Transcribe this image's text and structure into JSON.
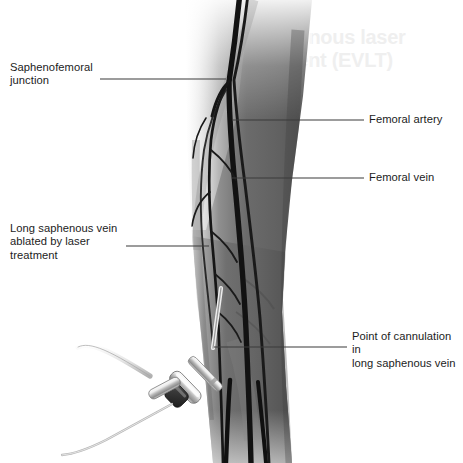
{
  "illustration": {
    "title": "Endovenous laser treatment of the long saphenous vein",
    "subject": "leg-venous-anatomy-with-laser-catheter",
    "background_color": "#ffffff",
    "skin_color": "#6e6e6e",
    "vessel_color": "#141414",
    "device_metal_color": "#d8d8d8",
    "device_hub_color": "#2e2e2e",
    "leader_color": "#3a3a3a",
    "text_color": "#1c1c1c"
  },
  "ghost_text": {
    "line1": "Endovenous laser",
    "line2": "treatment (EVLT)"
  },
  "labels": {
    "saphenofemoral_junction": {
      "text": "Saphenofemoral\njunction",
      "side": "left",
      "leader": {
        "x1": 100,
        "y1": 79,
        "x2": 226,
        "y2": 79
      }
    },
    "long_saphenous_vein": {
      "text": "Long saphenous vein\nablated by laser\ntreatment",
      "side": "left",
      "leader": {
        "x1": 126,
        "y1": 246,
        "x2": 209,
        "y2": 246
      }
    },
    "femoral_artery": {
      "text": "Femoral artery",
      "side": "right",
      "leader": {
        "x1": 232,
        "y1": 120,
        "x2": 364,
        "y2": 120
      }
    },
    "femoral_vein": {
      "text": "Femoral vein",
      "side": "right",
      "leader": {
        "x1": 232,
        "y1": 178,
        "x2": 364,
        "y2": 178
      }
    },
    "point_of_cannulation": {
      "text": "Point of cannulation in\nlong saphenous vein",
      "side": "right",
      "leader": {
        "x1": 214,
        "y1": 347,
        "x2": 347,
        "y2": 347
      }
    }
  },
  "anatomy": {
    "structures": [
      {
        "name": "femoral-vein",
        "role": "deep vein",
        "stroke": 5.2
      },
      {
        "name": "femoral-artery",
        "role": "deep artery",
        "stroke": 3.0
      },
      {
        "name": "long-saphenous-vein",
        "role": "superficial vein treated by laser",
        "stroke": 2.6
      },
      {
        "name": "saphenous-tributary",
        "role": "tributary branches",
        "stroke": 1.8,
        "count": 6
      }
    ],
    "junction_point": {
      "x": 228,
      "y": 80
    },
    "cannulation_point": {
      "x": 214,
      "y": 347
    }
  },
  "device": {
    "name": "laser-fibre-catheter",
    "parts": [
      "catheter-sheath",
      "metal-barrel",
      "dark-hub",
      "flexible-tube"
    ],
    "hub_position": {
      "x": 180,
      "y": 397
    },
    "tip_position": {
      "x": 214,
      "y": 347
    }
  }
}
